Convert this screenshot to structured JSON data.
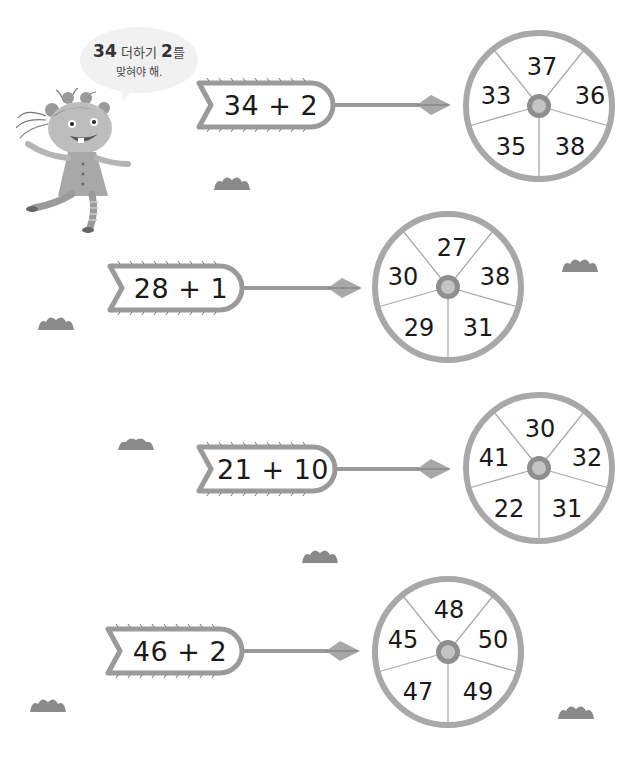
{
  "speech_bubble": {
    "number1": "34",
    "word1": "더하기",
    "number2": "2",
    "word2": "를",
    "line2": "맞혀야 해."
  },
  "colors": {
    "outline": "#9a9a9a",
    "ring": "#a8a8a8",
    "hub_outer": "#8e8e8e",
    "hub_inner": "#c4c4c4",
    "grass": "#8a8a8a",
    "bubble_bg": "#f1f1f1",
    "text": "#1a1a1a"
  },
  "puzzles": [
    {
      "expression": "34 + 2",
      "wheel": {
        "top": "37",
        "upper_right": "36",
        "lower_right": "38",
        "lower_left": "35",
        "upper_left": "33"
      }
    },
    {
      "expression": "28 + 1",
      "wheel": {
        "top": "27",
        "upper_right": "38",
        "lower_right": "31",
        "lower_left": "29",
        "upper_left": "30"
      }
    },
    {
      "expression": "21 + 10",
      "wheel": {
        "top": "30",
        "upper_right": "32",
        "lower_right": "31",
        "lower_left": "22",
        "upper_left": "41"
      }
    },
    {
      "expression": "46 + 2",
      "wheel": {
        "top": "48",
        "upper_right": "50",
        "lower_right": "49",
        "lower_left": "47",
        "upper_left": "45"
      }
    }
  ]
}
